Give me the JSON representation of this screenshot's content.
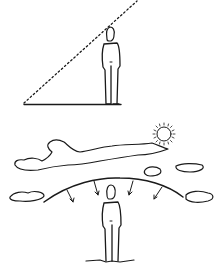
{
  "illustration": {
    "panels": [
      {
        "id": "sightline-panel",
        "elements": [
          "standing-figure",
          "dotted-diagonal-sightline",
          "ground-line"
        ]
      },
      {
        "id": "sky-dome-panel",
        "elements": [
          "sun",
          "clouds",
          "sky-dome-arc",
          "downward-arrows",
          "standing-figure",
          "ground-shadow"
        ],
        "arrow_count": 4
      }
    ],
    "colors": {
      "ink": "#1a1a1a",
      "background": "#ffffff"
    }
  }
}
